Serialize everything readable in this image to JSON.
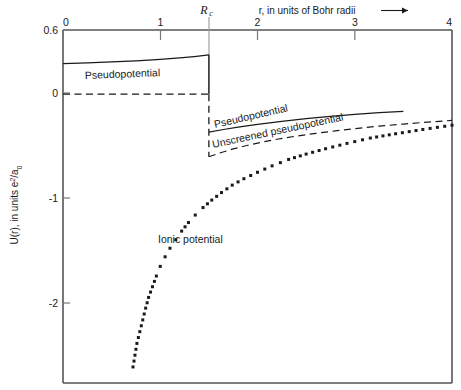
{
  "chart_data": {
    "type": "line",
    "title": "",
    "xlabel": "r, in units of Bohr radii",
    "ylabel": "U(r), in units e²/a₀",
    "xlim": [
      0,
      4
    ],
    "ylim": [
      -2.7,
      0.6
    ],
    "grid": false,
    "legend_position": "inline-annotations",
    "xticks": [
      "0",
      "1",
      "2",
      "3",
      "4"
    ],
    "xtick_values": [
      0,
      1,
      2,
      3,
      4
    ],
    "yticks": [
      "0.6",
      "0",
      "-1",
      "-2"
    ],
    "ytick_values": [
      0.6,
      0,
      -1,
      -2
    ],
    "xaxis_position": "top",
    "annotations": [
      {
        "name": "rc-marker",
        "text": "R",
        "subscript": "c",
        "x": 1.5,
        "note": "core radius vertical marker line"
      },
      {
        "name": "pseudopotential-inner-label",
        "text": "Pseudopotential",
        "x": 0.85,
        "y": 0.27
      },
      {
        "name": "pseudopotential-outer-label",
        "text": "Pseudopotential",
        "x": 1.95,
        "y": -0.26
      },
      {
        "name": "unscreened-pseudopotential-label",
        "text": "Unscreened pseudopotential",
        "x": 1.95,
        "y": -0.5
      },
      {
        "name": "ionic-potential-label",
        "text": "Ionic potential",
        "x": 1.25,
        "y": -1.4
      },
      {
        "name": "x-axis-arrow",
        "text": "⟶"
      }
    ],
    "series": [
      {
        "name": "Pseudopotential (inner, flat core region)",
        "style": "solid",
        "points": [
          [
            0.0,
            0.285
          ],
          [
            0.25,
            0.293
          ],
          [
            0.5,
            0.302
          ],
          [
            0.75,
            0.312
          ],
          [
            1.0,
            0.325
          ],
          [
            1.2,
            0.339
          ],
          [
            1.35,
            0.352
          ],
          [
            1.5,
            0.368
          ]
        ]
      },
      {
        "name": "Pseudopotential zero line (core region)",
        "style": "dashed",
        "points": [
          [
            0.0,
            0.0
          ],
          [
            1.5,
            0.0
          ]
        ]
      },
      {
        "name": "Pseudopotential discontinuity at Rc",
        "style": "solid-vertical",
        "points": [
          [
            1.5,
            0.368
          ],
          [
            1.5,
            0.0
          ]
        ]
      },
      {
        "name": "Unscreened pseudopotential discontinuity at Rc",
        "style": "dashed-vertical",
        "points": [
          [
            1.5,
            0.0
          ],
          [
            1.5,
            -0.585
          ]
        ]
      },
      {
        "name": "Pseudopotential (outer branch)",
        "style": "solid",
        "points": [
          [
            1.5,
            -0.355
          ],
          [
            1.65,
            -0.33
          ],
          [
            1.8,
            -0.308
          ],
          [
            2.0,
            -0.283
          ],
          [
            2.25,
            -0.254
          ],
          [
            2.5,
            -0.229
          ],
          [
            2.75,
            -0.207
          ],
          [
            3.0,
            -0.188
          ],
          [
            3.25,
            -0.172
          ],
          [
            3.5,
            -0.16
          ]
        ]
      },
      {
        "name": "Unscreened pseudopotential (outer branch)",
        "style": "dashed",
        "points": [
          [
            1.5,
            -0.585
          ],
          [
            1.62,
            -0.548
          ],
          [
            1.75,
            -0.512
          ],
          [
            1.9,
            -0.477
          ],
          [
            2.05,
            -0.447
          ],
          [
            2.2,
            -0.421
          ],
          [
            2.4,
            -0.392
          ],
          [
            2.6,
            -0.366
          ],
          [
            2.8,
            -0.343
          ],
          [
            3.0,
            -0.322
          ],
          [
            3.25,
            -0.299
          ],
          [
            3.5,
            -0.279
          ],
          [
            3.75,
            -0.261
          ],
          [
            4.0,
            -0.245
          ]
        ]
      },
      {
        "name": "Ionic potential",
        "style": "dotted",
        "points": [
          [
            0.72,
            -2.55
          ],
          [
            0.74,
            -2.44
          ],
          [
            0.76,
            -2.33
          ],
          [
            0.79,
            -2.22
          ],
          [
            0.82,
            -2.11
          ],
          [
            0.85,
            -2.0
          ],
          [
            0.88,
            -1.9
          ],
          [
            0.92,
            -1.8
          ],
          [
            0.96,
            -1.7
          ],
          [
            1.0,
            -1.61
          ],
          [
            1.05,
            -1.52
          ],
          [
            1.1,
            -1.44
          ],
          [
            1.16,
            -1.36
          ],
          [
            1.22,
            -1.28
          ],
          [
            1.29,
            -1.2
          ],
          [
            1.36,
            -1.13
          ],
          [
            1.44,
            -1.06
          ],
          [
            1.53,
            -0.99
          ],
          [
            1.63,
            -0.92
          ],
          [
            1.74,
            -0.85
          ],
          [
            1.86,
            -0.79
          ],
          [
            2.0,
            -0.73
          ],
          [
            2.15,
            -0.67
          ],
          [
            2.32,
            -0.61
          ],
          [
            2.5,
            -0.56
          ],
          [
            2.7,
            -0.51
          ],
          [
            2.92,
            -0.46
          ],
          [
            3.16,
            -0.41
          ],
          [
            3.42,
            -0.37
          ],
          [
            3.7,
            -0.33
          ],
          [
            4.0,
            -0.29
          ]
        ]
      }
    ]
  },
  "figure": {
    "x_axis_title": "r, in units of Bohr radii",
    "x_axis_arrow": "⟶",
    "y_axis_title_main": "U(r), in units e",
    "y_axis_title_sup": "2",
    "y_axis_title_tail": "/a",
    "y_axis_title_sub": "0",
    "rc_symbol": "R",
    "rc_subscript": "c",
    "xtick_0": "0",
    "xtick_1": "1",
    "xtick_2": "2",
    "xtick_3": "3",
    "xtick_4": "4",
    "ytick_top": "0.6",
    "ytick_zero": "0",
    "ytick_minus1": "-1",
    "ytick_minus2": "-2",
    "label_pseudo_inner": "Pseudopotential",
    "label_pseudo_outer": "Pseudopotential",
    "label_unscreened": "Unscreened pseudopotential",
    "label_ionic": "Ionic potential"
  },
  "colors": {
    "ink": "#1a1a1a",
    "axis": "#555555",
    "background": "#ffffff"
  }
}
